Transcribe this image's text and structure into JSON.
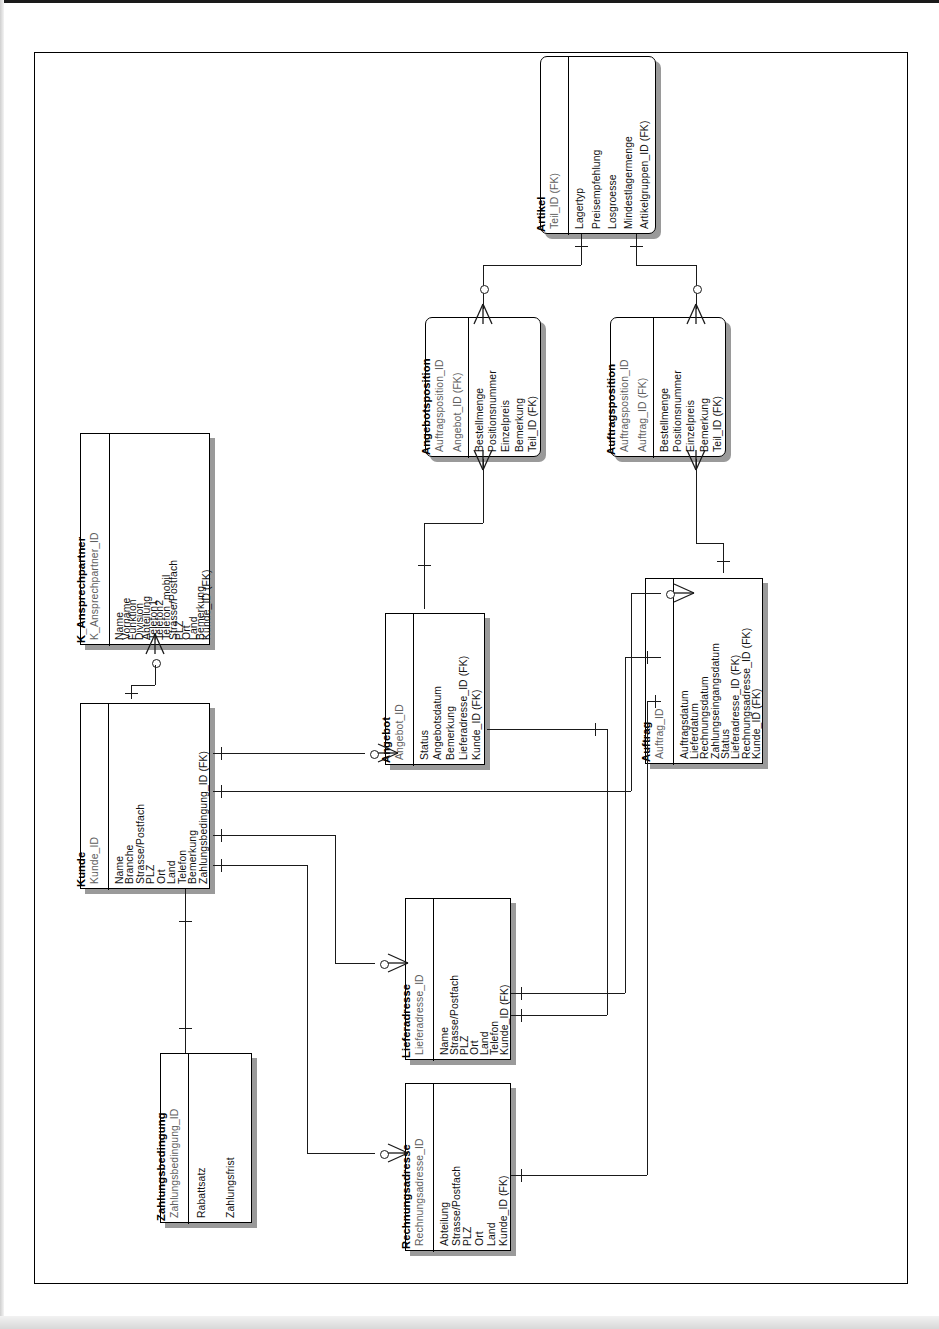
{
  "document": {
    "kind": "entity-relationship-diagram",
    "title": "ER-Diagramm Kunden- und Auftragsverwaltung",
    "orientation": "rotated-90-ccw",
    "notation": "crow's foot (IE)",
    "language": "de"
  },
  "entities": [
    {
      "id": "artikel",
      "name": "Artikel",
      "keys": [
        "Teil_ID (FK)"
      ],
      "attributes": [
        "Lagertyp",
        "Preisempfehlung",
        "Losgroesse",
        "Mindestlagermenge",
        "Artikelgruppen_ID (FK)"
      ]
    },
    {
      "id": "angebotsposition",
      "name": "Angebotsposition",
      "keys": [
        "Auftragsposition_ID",
        "Angebot_ID (FK)"
      ],
      "attributes": [
        "Bestellmenge",
        "Positionsnummer",
        "Einzelpreis",
        "Bemerkung",
        "Teil_ID (FK)"
      ]
    },
    {
      "id": "auftragsposition",
      "name": "Auftragsposition",
      "keys": [
        "Auftragsposition_ID",
        "Auftrag_ID (FK)"
      ],
      "attributes": [
        "Bestellmenge",
        "Positionsnummer",
        "Einzelpreis",
        "Bemerkung",
        "Teil_ID (FK)"
      ]
    },
    {
      "id": "k_ansprechpartner",
      "name": "K_Ansprechpartner",
      "keys": [
        "K_Ansprechpartner_ID"
      ],
      "attributes": [
        "Name",
        "Vorname",
        "Funktion",
        "Division",
        "Abteilung",
        "Telefon1",
        "Telefon2",
        "Telefon_mobil",
        "Strasse/Postfach",
        "PLZ",
        "Ort",
        "Land",
        "Bemerkung",
        "Kunde_ID (FK)"
      ]
    },
    {
      "id": "kunde",
      "name": "Kunde",
      "keys": [
        "Kunde_ID"
      ],
      "attributes": [
        "Name",
        "Branche",
        "Strasse/Postfach",
        "PLZ",
        "Ort",
        "Land",
        "Telefon",
        "Bemerkung",
        "Zahlungsbedingung_ID (FK)"
      ]
    },
    {
      "id": "angebot",
      "name": "Angebot",
      "keys": [
        "Angebot_ID"
      ],
      "attributes": [
        "Status",
        "Angebotsdatum",
        "Bemerkung",
        "Lieferadresse_ID (FK)",
        "Kunde_ID (FK)"
      ]
    },
    {
      "id": "auftrag",
      "name": "Auftrag",
      "keys": [
        "Auftrag_ID"
      ],
      "attributes": [
        "Auftragsdatum",
        "Lieferdatum",
        "Rechnungsdatum",
        "Zahlungseingangsdatum",
        "Status",
        "Lieferadresse_ID (FK)",
        "Rechnungsadresse_ID (FK)",
        "Kunde_ID (FK)"
      ]
    },
    {
      "id": "lieferadresse",
      "name": "Lieferadresse",
      "keys": [
        "Lieferadresse_ID"
      ],
      "attributes": [
        "Name",
        "Strasse/Postfach",
        "PLZ",
        "Ort",
        "Land",
        "Telefon",
        "Kunde_ID (FK)"
      ]
    },
    {
      "id": "rechnungsadresse",
      "name": "Rechnungsadresse",
      "keys": [
        "Rechnungsadresse_ID"
      ],
      "attributes": [
        "Abteilung",
        "Strasse/Postfach",
        "PLZ",
        "Ort",
        "Land",
        "Kunde_ID (FK)"
      ]
    },
    {
      "id": "zahlungsbedingung",
      "name": "Zahlungsbedingung",
      "keys": [
        "Zahlungsbedingung_ID"
      ],
      "attributes": [
        "Rabattsatz",
        "Zahlungsfrist"
      ]
    }
  ],
  "relationships": [
    {
      "from": "artikel",
      "to": "angebotsposition",
      "from_card": "one",
      "to_card": "zero-or-many"
    },
    {
      "from": "artikel",
      "to": "auftragsposition",
      "from_card": "one",
      "to_card": "zero-or-many"
    },
    {
      "from": "angebot",
      "to": "angebotsposition",
      "from_card": "one",
      "to_card": "many"
    },
    {
      "from": "auftrag",
      "to": "auftragsposition",
      "from_card": "one",
      "to_card": "many"
    },
    {
      "from": "kunde",
      "to": "k_ansprechpartner",
      "from_card": "one",
      "to_card": "zero-or-many"
    },
    {
      "from": "kunde",
      "to": "angebot",
      "from_card": "one",
      "to_card": "zero-or-many"
    },
    {
      "from": "kunde",
      "to": "auftrag",
      "from_card": "one",
      "to_card": "zero-or-many"
    },
    {
      "from": "kunde",
      "to": "lieferadresse",
      "from_card": "one",
      "to_card": "zero-or-many"
    },
    {
      "from": "kunde",
      "to": "rechnungsadresse",
      "from_card": "one",
      "to_card": "zero-or-many"
    },
    {
      "from": "zahlungsbedingung",
      "to": "kunde",
      "from_card": "one",
      "to_card": "one"
    },
    {
      "from": "lieferadresse",
      "to": "angebot",
      "from_card": "one",
      "to_card": "one"
    },
    {
      "from": "lieferadresse",
      "to": "auftrag",
      "from_card": "one",
      "to_card": "one"
    },
    {
      "from": "rechnungsadresse",
      "to": "auftrag",
      "from_card": "one",
      "to_card": "one"
    }
  ],
  "colors": {
    "line": "#1a1a1a",
    "box_border": "#000000",
    "box_fill": "#ffffff",
    "shadow": "#9a9a9a",
    "key_text": "#5e5e5e",
    "attr_text": "#111111"
  }
}
